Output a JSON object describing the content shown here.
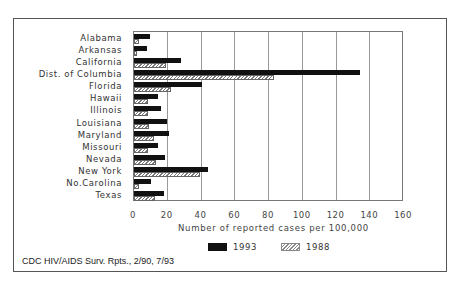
{
  "chart_data": {
    "type": "bar",
    "orientation": "horizontal",
    "title": "",
    "xlabel": "Number of reported cases per 100,000",
    "ylabel": "",
    "xlim": [
      0,
      160
    ],
    "xticks": [
      0,
      20,
      40,
      60,
      80,
      100,
      120,
      140,
      160
    ],
    "grid": true,
    "legend_position": "bottom",
    "categories": [
      "Alabama",
      "Arkansas",
      "California",
      "Dist. of Columbia",
      "Florida",
      "Hawaii",
      "Illinois",
      "Louisiana",
      "Maryland",
      "Missouri",
      "Nevada",
      "New York",
      "No.Carolina",
      "Texas"
    ],
    "series": [
      {
        "name": "1993",
        "pattern": "solid",
        "color": "#111111",
        "values": [
          9.5,
          7.5,
          28,
          134,
          40,
          14.5,
          16,
          19.5,
          21,
          14,
          18.5,
          44,
          10,
          18
        ]
      },
      {
        "name": "1988",
        "pattern": "hatched",
        "color": "#777777",
        "values": [
          3,
          1.5,
          19,
          83,
          22,
          8.5,
          8.5,
          9,
          12,
          8,
          13,
          39,
          3,
          12.5
        ]
      }
    ],
    "source": "CDC HIV/AIDS Surv. Rpts., 2/90, 7/93"
  },
  "axis": {
    "ticks": [
      "0",
      "20",
      "40",
      "60",
      "80",
      "100",
      "120",
      "140",
      "160"
    ],
    "xlabel": "Number of reported cases per 100,000"
  },
  "legend": {
    "items": [
      {
        "label": "1993"
      },
      {
        "label": "1988"
      }
    ]
  },
  "caption": "CDC HIV/AIDS Surv. Rpts., 2/90, 7/93"
}
